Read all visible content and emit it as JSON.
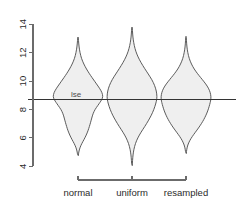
{
  "chart_data": {
    "type": "violin",
    "title": "",
    "xlabel": "",
    "ylabel": "",
    "ylim": [
      3.6,
      14.3
    ],
    "yticks": [
      4,
      6,
      8,
      10,
      12,
      14
    ],
    "ytick_labels": [
      "4",
      "6",
      "8",
      "10",
      "12",
      "14"
    ],
    "grid": false,
    "legend": "none",
    "categories": [
      "normal",
      "uniform",
      "resampled"
    ],
    "annotations": [
      {
        "label": "lse",
        "type": "horizontal-reference-line",
        "value": 8.68
      }
    ],
    "fill_color": "#efefef",
    "outline_color": "#4a4a4a",
    "axis_color": "#6b6b6b",
    "reference_line_color": "#333333",
    "series": [
      {
        "name": "normal",
        "center": 8.7,
        "min": 4.75,
        "max": 13.1,
        "density": [
          {
            "y": 4.75,
            "w": 0.012
          },
          {
            "y": 5.0,
            "w": 0.03
          },
          {
            "y": 5.3,
            "w": 0.075
          },
          {
            "y": 5.6,
            "w": 0.15
          },
          {
            "y": 5.9,
            "w": 0.245
          },
          {
            "y": 6.2,
            "w": 0.33
          },
          {
            "y": 6.5,
            "w": 0.4
          },
          {
            "y": 6.8,
            "w": 0.455
          },
          {
            "y": 7.1,
            "w": 0.505
          },
          {
            "y": 7.4,
            "w": 0.55
          },
          {
            "y": 7.7,
            "w": 0.6
          },
          {
            "y": 8.0,
            "w": 0.68
          },
          {
            "y": 8.3,
            "w": 0.8
          },
          {
            "y": 8.5,
            "w": 0.88
          },
          {
            "y": 8.68,
            "w": 0.945
          },
          {
            "y": 8.9,
            "w": 1.0
          },
          {
            "y": 9.2,
            "w": 0.96
          },
          {
            "y": 9.5,
            "w": 0.86
          },
          {
            "y": 9.8,
            "w": 0.74
          },
          {
            "y": 10.1,
            "w": 0.62
          },
          {
            "y": 10.4,
            "w": 0.5
          },
          {
            "y": 10.7,
            "w": 0.39
          },
          {
            "y": 11.0,
            "w": 0.29
          },
          {
            "y": 11.4,
            "w": 0.18
          },
          {
            "y": 11.8,
            "w": 0.105
          },
          {
            "y": 12.2,
            "w": 0.06
          },
          {
            "y": 12.6,
            "w": 0.03
          },
          {
            "y": 13.1,
            "w": 0.01
          }
        ]
      },
      {
        "name": "uniform",
        "center": 8.7,
        "min": 4.05,
        "max": 13.8,
        "density": [
          {
            "y": 4.05,
            "w": 0.01
          },
          {
            "y": 4.4,
            "w": 0.022
          },
          {
            "y": 4.8,
            "w": 0.04
          },
          {
            "y": 5.2,
            "w": 0.075
          },
          {
            "y": 5.6,
            "w": 0.135
          },
          {
            "y": 6.0,
            "w": 0.23
          },
          {
            "y": 6.4,
            "w": 0.36
          },
          {
            "y": 6.8,
            "w": 0.51
          },
          {
            "y": 7.2,
            "w": 0.65
          },
          {
            "y": 7.6,
            "w": 0.775
          },
          {
            "y": 8.0,
            "w": 0.875
          },
          {
            "y": 8.4,
            "w": 0.95
          },
          {
            "y": 8.68,
            "w": 0.985
          },
          {
            "y": 8.9,
            "w": 1.0
          },
          {
            "y": 9.3,
            "w": 0.975
          },
          {
            "y": 9.7,
            "w": 0.905
          },
          {
            "y": 10.1,
            "w": 0.795
          },
          {
            "y": 10.5,
            "w": 0.65
          },
          {
            "y": 10.9,
            "w": 0.5
          },
          {
            "y": 11.3,
            "w": 0.36
          },
          {
            "y": 11.7,
            "w": 0.24
          },
          {
            "y": 12.1,
            "w": 0.15
          },
          {
            "y": 12.5,
            "w": 0.09
          },
          {
            "y": 12.9,
            "w": 0.05
          },
          {
            "y": 13.3,
            "w": 0.026
          },
          {
            "y": 13.8,
            "w": 0.01
          }
        ]
      },
      {
        "name": "resampled",
        "center": 8.7,
        "min": 4.9,
        "max": 13.15,
        "density": [
          {
            "y": 4.9,
            "w": 0.012
          },
          {
            "y": 5.2,
            "w": 0.03
          },
          {
            "y": 5.5,
            "w": 0.07
          },
          {
            "y": 5.8,
            "w": 0.145
          },
          {
            "y": 6.1,
            "w": 0.25
          },
          {
            "y": 6.4,
            "w": 0.375
          },
          {
            "y": 6.7,
            "w": 0.5
          },
          {
            "y": 7.0,
            "w": 0.615
          },
          {
            "y": 7.3,
            "w": 0.715
          },
          {
            "y": 7.6,
            "w": 0.8
          },
          {
            "y": 7.9,
            "w": 0.87
          },
          {
            "y": 8.2,
            "w": 0.925
          },
          {
            "y": 8.5,
            "w": 0.97
          },
          {
            "y": 8.68,
            "w": 0.99
          },
          {
            "y": 8.9,
            "w": 1.0
          },
          {
            "y": 9.2,
            "w": 0.97
          },
          {
            "y": 9.5,
            "w": 0.9
          },
          {
            "y": 9.8,
            "w": 0.79
          },
          {
            "y": 10.1,
            "w": 0.655
          },
          {
            "y": 10.4,
            "w": 0.515
          },
          {
            "y": 10.7,
            "w": 0.385
          },
          {
            "y": 11.0,
            "w": 0.275
          },
          {
            "y": 11.4,
            "w": 0.165
          },
          {
            "y": 11.8,
            "w": 0.095
          },
          {
            "y": 12.2,
            "w": 0.052
          },
          {
            "y": 12.6,
            "w": 0.026
          },
          {
            "y": 13.15,
            "w": 0.01
          }
        ]
      }
    ]
  },
  "axes": {
    "y_axis_name": "value-axis",
    "x_axis_name": "category-axis"
  }
}
